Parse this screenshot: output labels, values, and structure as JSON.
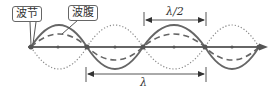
{
  "labels": {
    "node": "波节",
    "antinode": "波腹"
  },
  "dimensions": {
    "half_wavelength": "λ/2",
    "wavelength": "λ"
  },
  "caption": ""
}
